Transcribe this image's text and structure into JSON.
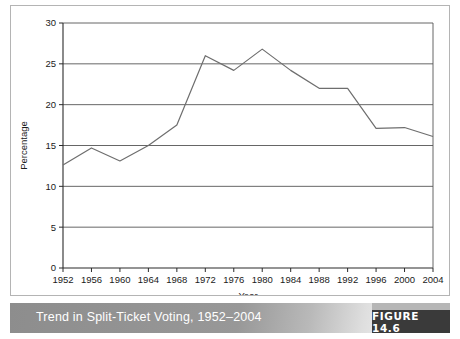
{
  "figure": {
    "caption": "Trend in Split-Ticket Voting, 1952–2004",
    "badge_label": "FIGURE 14.6"
  },
  "colors": {
    "line": "#6e6e6e",
    "gridline": "#555555",
    "axis": "#2b2b2b",
    "panel_border": "#b4b4b4",
    "caption_text": "#ffffff",
    "badge_background": "#3a3a3a"
  },
  "chart_data": {
    "type": "line",
    "title": "",
    "xlabel": "Year",
    "ylabel": "Percentage",
    "categories": [
      "1952",
      "1956",
      "1960",
      "1964",
      "1968",
      "1972",
      "1976",
      "1980",
      "1984",
      "1988",
      "1992",
      "1996",
      "2000",
      "2004"
    ],
    "x": [
      1952,
      1956,
      1960,
      1964,
      1968,
      1972,
      1976,
      1980,
      1984,
      1988,
      1992,
      1996,
      2000,
      2004
    ],
    "values": [
      12.6,
      14.7,
      13.1,
      15.0,
      17.5,
      26.0,
      24.2,
      26.8,
      24.2,
      22.0,
      22.0,
      17.1,
      17.2,
      16.1
    ],
    "series": [
      {
        "name": "Split-ticket voting",
        "values": [
          12.6,
          14.7,
          13.1,
          15.0,
          17.5,
          26.0,
          24.2,
          26.8,
          24.2,
          22.0,
          22.0,
          17.1,
          17.2,
          16.1
        ]
      }
    ],
    "ylim": [
      0,
      30
    ],
    "yticks": [
      0,
      5,
      10,
      15,
      20,
      25,
      30
    ],
    "ytick_labels": [
      "0",
      "5",
      "10",
      "15",
      "20",
      "25",
      "30"
    ],
    "xlim": [
      1952,
      2004
    ],
    "grid": "horizontal",
    "legend": "none"
  }
}
